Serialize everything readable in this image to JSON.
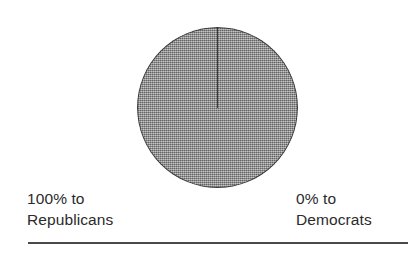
{
  "chart_data": {
    "type": "pie",
    "title": "",
    "subtitle": "",
    "xlabel": "",
    "ylabel": "",
    "legend_position": "below",
    "grid": false,
    "categories": [
      "Republicans",
      "Democrats"
    ],
    "values": [
      100,
      0
    ],
    "unit": "%",
    "slices": [
      {
        "label": "Republicans",
        "value": 100,
        "display": "100%",
        "color": "#8b8b8b"
      },
      {
        "label": "Democrats",
        "value": 0,
        "display": "0%",
        "color": "#ffffff"
      }
    ],
    "start_angle_deg": 0,
    "annotations": [
      "100% to Republicans",
      "0% to Democrats"
    ]
  },
  "figure": {
    "background_color": "#ffffff",
    "pie": {
      "fill_color": "#8b8b8b",
      "edge_color": "#3c3c3c",
      "radius_line_color": "#3a3a3a",
      "radius_line_name": "slice-boundary-12-oclock"
    },
    "rule": {
      "color": "#4a4a4a"
    }
  },
  "labels": {
    "left": {
      "percent_line": "100% to",
      "party_line": "Republicans"
    },
    "right": {
      "percent_line": "0% to",
      "party_line": "Democrats"
    }
  }
}
